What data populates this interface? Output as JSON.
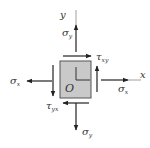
{
  "diagram": {
    "type": "plane-stress-element",
    "colors": {
      "element_fill": "#c9c9c9",
      "element_border": "#555555",
      "arrow": "#222222",
      "axis": "#888888",
      "text": "#333333"
    },
    "origin_label": "O",
    "axes": {
      "x_label": "x",
      "y_label": "y"
    },
    "stresses": {
      "sigma_x_right": {
        "symbol": "σ",
        "sub": "x",
        "direction": "right"
      },
      "sigma_x_left": {
        "symbol": "σ",
        "sub": "x",
        "direction": "left"
      },
      "sigma_y_top": {
        "symbol": "σ",
        "sub": "y",
        "direction": "up"
      },
      "sigma_y_bottom": {
        "symbol": "σ",
        "sub": "y",
        "direction": "down"
      },
      "tau_xy": {
        "symbol": "τ",
        "sub": "xy",
        "direction": "right (top face)"
      },
      "tau_yx": {
        "symbol": "τ",
        "sub": "yx",
        "direction": "left (bottom face)"
      },
      "tau_right_face": {
        "direction": "up"
      },
      "tau_left_face": {
        "direction": "down"
      }
    }
  }
}
